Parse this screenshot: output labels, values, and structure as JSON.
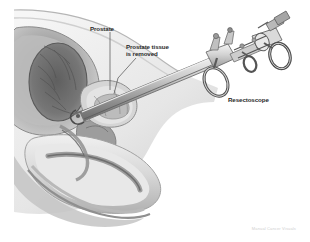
{
  "figure": {
    "credit": "Manual Cancer Visuals",
    "background_color": "#ffffff",
    "ink_color": "#2a2a2a"
  },
  "labels": {
    "prostate": "Prostate",
    "tissue_removed": "Prostate tissue\nis removed",
    "resectoscope": "Resectoscope"
  },
  "palette": {
    "outline": "#8a8a8a",
    "dark_tissue": "#6e6e6e",
    "mid_tissue": "#a3a3a3",
    "light_tissue": "#c9c9c9",
    "pale_tissue": "#e2e2e2",
    "highlight": "#f2f2f2",
    "instrument_body": "#b4b4b4",
    "instrument_dark": "#5d5d5d",
    "instrument_light": "#dcdcdc",
    "leader_line": "#555555"
  },
  "anatomy_parts": [
    "bladder",
    "bladder-lumen",
    "prostate-gland",
    "prostatic-urethra",
    "pelvic-bone",
    "penis-shaft",
    "corpus-spongiosum",
    "penile-urethra",
    "scrotum-base",
    "rectum"
  ],
  "instrument_parts": [
    "resectoscope-sheath",
    "resectoscope-shaft",
    "cutting-loop",
    "working-element",
    "thumb-ring",
    "finger-ring-upper",
    "finger-ring-lower",
    "eyepiece",
    "light-post",
    "irrigation-port"
  ]
}
